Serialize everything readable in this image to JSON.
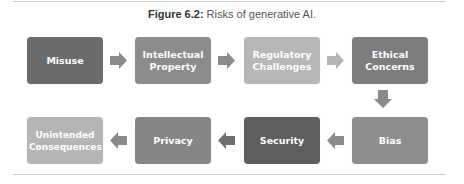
{
  "figure": {
    "label": "Figure 6.2:",
    "title": "Risks of generative AI."
  },
  "steps": [
    {
      "label": "Misuse",
      "color": "#6b6b6b"
    },
    {
      "label": "Intellectual Property",
      "color": "#8c8c8c"
    },
    {
      "label": "Regulatory Challenges",
      "color": "#b7b7b7"
    },
    {
      "label": "Ethical Concerns",
      "color": "#7d7d7d"
    },
    {
      "label": "Bias",
      "color": "#8e8e8e"
    },
    {
      "label": "Security",
      "color": "#5e5e5e"
    },
    {
      "label": "Privacy",
      "color": "#868686"
    },
    {
      "label": "Unintended Consequences",
      "color": "#b5b5b5"
    }
  ],
  "arrows": {
    "dark": "#8a8a8a",
    "light": "#b3b3b3"
  }
}
